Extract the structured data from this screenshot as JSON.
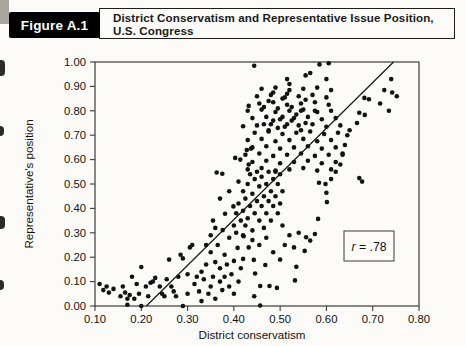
{
  "figure": {
    "label": "Figure A.1",
    "title_line1": "District Conservatism and Representative Issue Position,",
    "title_line2": "U.S. Congress"
  },
  "colors": {
    "page_bg": "#fcfbf8",
    "ink": "#121212",
    "frame": "#3c3c3c",
    "header_bg": "#000000",
    "header_text": "#ffffff"
  },
  "chart_data": {
    "type": "scatter",
    "title": "District Conservatism and Representative Issue Position, U.S. Congress",
    "xlabel": "District conservatism",
    "ylabel": "Representative's position",
    "xlim": [
      0.1,
      0.8
    ],
    "ylim": [
      0.0,
      1.0
    ],
    "x_ticks": [
      "0.10",
      "0.20",
      "0.30",
      "0.40",
      "0.50",
      "0.60",
      "0.70",
      "0.80"
    ],
    "y_ticks": [
      "0.00",
      "0.10",
      "0.20",
      "0.30",
      "0.40",
      "0.50",
      "0.60",
      "0.70",
      "0.80",
      "0.90",
      "1.00"
    ],
    "grid": false,
    "frame": true,
    "annotation": {
      "text": "r = .78"
    },
    "regression_line": {
      "x1": 0.211,
      "y1": 0.0,
      "x2": 0.745,
      "y2": 1.0
    },
    "points": [
      [
        0.11,
        0.09
      ],
      [
        0.118,
        0.065
      ],
      [
        0.125,
        0.08
      ],
      [
        0.13,
        0.055
      ],
      [
        0.14,
        0.07
      ],
      [
        0.155,
        0.04
      ],
      [
        0.16,
        0.08
      ],
      [
        0.165,
        0.055
      ],
      [
        0.17,
        0.03
      ],
      [
        0.17,
        0.005
      ],
      [
        0.175,
        0.045
      ],
      [
        0.18,
        0.12
      ],
      [
        0.185,
        0.03
      ],
      [
        0.19,
        0.09
      ],
      [
        0.195,
        0.05
      ],
      [
        0.2,
        0.16
      ],
      [
        0.2,
        0.0
      ],
      [
        0.21,
        0.08
      ],
      [
        0.215,
        0.04
      ],
      [
        0.22,
        0.095
      ],
      [
        0.225,
        0.1
      ],
      [
        0.23,
        0.115
      ],
      [
        0.24,
        0.08
      ],
      [
        0.245,
        0.05
      ],
      [
        0.25,
        0.04
      ],
      [
        0.255,
        0.11
      ],
      [
        0.26,
        0.19
      ],
      [
        0.265,
        0.08
      ],
      [
        0.27,
        0.06
      ],
      [
        0.275,
        0.04
      ],
      [
        0.28,
        0.12
      ],
      [
        0.285,
        0.21
      ],
      [
        0.29,
        0.195
      ],
      [
        0.29,
        0.0
      ],
      [
        0.3,
        0.05
      ],
      [
        0.3,
        0.13
      ],
      [
        0.305,
        0.24
      ],
      [
        0.31,
        0.25
      ],
      [
        0.315,
        0.09
      ],
      [
        0.32,
        0.12
      ],
      [
        0.325,
        0.06
      ],
      [
        0.33,
        0.02
      ],
      [
        0.33,
        0.14
      ],
      [
        0.335,
        0.11
      ],
      [
        0.34,
        0.17
      ],
      [
        0.345,
        0.05
      ],
      [
        0.35,
        0.08
      ],
      [
        0.35,
        0.22
      ],
      [
        0.355,
        0.12
      ],
      [
        0.36,
        0.03
      ],
      [
        0.36,
        0.18
      ],
      [
        0.365,
        0.25
      ],
      [
        0.37,
        0.1
      ],
      [
        0.37,
        0.155
      ],
      [
        0.375,
        0.065
      ],
      [
        0.38,
        0.12
      ],
      [
        0.38,
        0.21
      ],
      [
        0.385,
        0.17
      ],
      [
        0.39,
        0.08
      ],
      [
        0.39,
        0.28
      ],
      [
        0.395,
        0.13
      ],
      [
        0.4,
        0.05
      ],
      [
        0.4,
        0.185
      ],
      [
        0.405,
        0.3
      ],
      [
        0.408,
        0.238
      ],
      [
        0.41,
        0.1
      ],
      [
        0.415,
        0.155
      ],
      [
        0.42,
        0.193
      ],
      [
        0.42,
        0.29
      ],
      [
        0.421,
        0.286
      ],
      [
        0.381,
        0.378
      ],
      [
        0.376,
        0.311
      ],
      [
        0.399,
        0.408
      ],
      [
        0.36,
        0.32
      ],
      [
        0.35,
        0.29
      ],
      [
        0.34,
        0.25
      ],
      [
        0.355,
        0.35
      ],
      [
        0.37,
        0.44
      ],
      [
        0.39,
        0.47
      ],
      [
        0.41,
        0.51
      ],
      [
        0.4,
        0.33
      ],
      [
        0.405,
        0.38
      ],
      [
        0.41,
        0.42
      ],
      [
        0.415,
        0.35
      ],
      [
        0.42,
        0.47
      ],
      [
        0.42,
        0.39
      ],
      [
        0.425,
        0.33
      ],
      [
        0.425,
        0.44
      ],
      [
        0.43,
        0.5
      ],
      [
        0.43,
        0.36
      ],
      [
        0.435,
        0.41
      ],
      [
        0.435,
        0.54
      ],
      [
        0.44,
        0.31
      ],
      [
        0.44,
        0.46
      ],
      [
        0.445,
        0.52
      ],
      [
        0.445,
        0.38
      ],
      [
        0.45,
        0.43
      ],
      [
        0.45,
        0.55
      ],
      [
        0.455,
        0.35
      ],
      [
        0.455,
        0.49
      ],
      [
        0.46,
        0.41
      ],
      [
        0.46,
        0.53
      ],
      [
        0.465,
        0.45
      ],
      [
        0.465,
        0.32
      ],
      [
        0.47,
        0.5
      ],
      [
        0.47,
        0.38
      ],
      [
        0.475,
        0.55
      ],
      [
        0.475,
        0.43
      ],
      [
        0.48,
        0.47
      ],
      [
        0.48,
        0.35
      ],
      [
        0.485,
        0.52
      ],
      [
        0.485,
        0.41
      ],
      [
        0.49,
        0.55
      ],
      [
        0.49,
        0.45
      ],
      [
        0.495,
        0.38
      ],
      [
        0.495,
        0.5
      ],
      [
        0.5,
        0.42
      ],
      [
        0.5,
        0.54
      ],
      [
        0.505,
        0.47
      ],
      [
        0.505,
        0.33
      ],
      [
        0.43,
        0.56
      ],
      [
        0.46,
        0.565
      ],
      [
        0.49,
        0.555
      ],
      [
        0.52,
        0.56
      ],
      [
        0.55,
        0.565
      ],
      [
        0.58,
        0.555
      ],
      [
        0.61,
        0.56
      ],
      [
        0.44,
        0.59
      ],
      [
        0.47,
        0.595
      ],
      [
        0.5,
        0.585
      ],
      [
        0.53,
        0.59
      ],
      [
        0.56,
        0.595
      ],
      [
        0.59,
        0.585
      ],
      [
        0.62,
        0.59
      ],
      [
        0.425,
        0.62
      ],
      [
        0.455,
        0.625
      ],
      [
        0.485,
        0.615
      ],
      [
        0.515,
        0.62
      ],
      [
        0.545,
        0.625
      ],
      [
        0.575,
        0.615
      ],
      [
        0.605,
        0.62
      ],
      [
        0.635,
        0.625
      ],
      [
        0.44,
        0.65
      ],
      [
        0.47,
        0.655
      ],
      [
        0.5,
        0.645
      ],
      [
        0.53,
        0.65
      ],
      [
        0.56,
        0.655
      ],
      [
        0.59,
        0.645
      ],
      [
        0.62,
        0.65
      ],
      [
        0.43,
        0.68
      ],
      [
        0.46,
        0.685
      ],
      [
        0.49,
        0.675
      ],
      [
        0.52,
        0.68
      ],
      [
        0.55,
        0.685
      ],
      [
        0.58,
        0.675
      ],
      [
        0.61,
        0.68
      ],
      [
        0.445,
        0.71
      ],
      [
        0.475,
        0.715
      ],
      [
        0.505,
        0.705
      ],
      [
        0.535,
        0.71
      ],
      [
        0.565,
        0.715
      ],
      [
        0.595,
        0.705
      ],
      [
        0.625,
        0.71
      ],
      [
        0.42,
        0.737
      ],
      [
        0.45,
        0.74
      ],
      [
        0.48,
        0.745
      ],
      [
        0.51,
        0.735
      ],
      [
        0.54,
        0.74
      ],
      [
        0.57,
        0.745
      ],
      [
        0.6,
        0.735
      ],
      [
        0.63,
        0.74
      ],
      [
        0.44,
        0.77
      ],
      [
        0.47,
        0.775
      ],
      [
        0.5,
        0.765
      ],
      [
        0.53,
        0.77
      ],
      [
        0.56,
        0.775
      ],
      [
        0.59,
        0.765
      ],
      [
        0.62,
        0.77
      ],
      [
        0.43,
        0.8
      ],
      [
        0.46,
        0.805
      ],
      [
        0.49,
        0.795
      ],
      [
        0.52,
        0.8
      ],
      [
        0.55,
        0.805
      ],
      [
        0.58,
        0.795
      ],
      [
        0.61,
        0.8
      ],
      [
        0.432,
        0.82
      ],
      [
        0.455,
        0.83
      ],
      [
        0.485,
        0.835
      ],
      [
        0.515,
        0.825
      ],
      [
        0.545,
        0.83
      ],
      [
        0.575,
        0.835
      ],
      [
        0.605,
        0.825
      ],
      [
        0.45,
        0.86
      ],
      [
        0.48,
        0.865
      ],
      [
        0.51,
        0.855
      ],
      [
        0.54,
        0.86
      ],
      [
        0.57,
        0.865
      ],
      [
        0.6,
        0.855
      ],
      [
        0.46,
        0.89
      ],
      [
        0.49,
        0.895
      ],
      [
        0.52,
        0.885
      ],
      [
        0.55,
        0.89
      ],
      [
        0.58,
        0.895
      ],
      [
        0.61,
        0.885
      ],
      [
        0.475,
        0.72
      ],
      [
        0.495,
        0.73
      ],
      [
        0.515,
        0.745
      ],
      [
        0.525,
        0.76
      ],
      [
        0.545,
        0.72
      ],
      [
        0.485,
        0.76
      ],
      [
        0.505,
        0.775
      ],
      [
        0.465,
        0.745
      ],
      [
        0.535,
        0.785
      ],
      [
        0.555,
        0.75
      ],
      [
        0.495,
        0.81
      ],
      [
        0.525,
        0.815
      ],
      [
        0.475,
        0.84
      ],
      [
        0.555,
        0.845
      ],
      [
        0.505,
        0.85
      ],
      [
        0.465,
        0.815
      ],
      [
        0.545,
        0.8
      ],
      [
        0.515,
        0.87
      ],
      [
        0.485,
        0.875
      ],
      [
        0.575,
        0.8
      ],
      [
        0.363,
        0.547
      ],
      [
        0.375,
        0.542
      ],
      [
        0.403,
        0.607
      ],
      [
        0.414,
        0.6
      ],
      [
        0.428,
        0.639
      ],
      [
        0.437,
        0.645
      ],
      [
        0.432,
        0.58
      ],
      [
        0.444,
        0.985
      ],
      [
        0.585,
        0.99
      ],
      [
        0.605,
        0.995
      ],
      [
        0.515,
        0.93
      ],
      [
        0.52,
        0.91
      ],
      [
        0.555,
        0.945
      ],
      [
        0.6,
        0.93
      ],
      [
        0.565,
        0.955
      ],
      [
        0.74,
        0.93
      ],
      [
        0.742,
        0.875
      ],
      [
        0.725,
        0.885
      ],
      [
        0.735,
        0.8
      ],
      [
        0.716,
        0.83
      ],
      [
        0.682,
        0.853
      ],
      [
        0.692,
        0.847
      ],
      [
        0.671,
        0.792
      ],
      [
        0.683,
        0.783
      ],
      [
        0.666,
        0.75
      ],
      [
        0.671,
        0.524
      ],
      [
        0.677,
        0.51
      ],
      [
        0.752,
        0.86
      ],
      [
        0.556,
        0.282
      ],
      [
        0.565,
        0.268
      ],
      [
        0.553,
        0.226
      ],
      [
        0.575,
        0.295
      ],
      [
        0.582,
        0.357
      ],
      [
        0.601,
        0.426
      ],
      [
        0.6,
        0.464
      ],
      [
        0.598,
        0.5
      ],
      [
        0.584,
        0.505
      ],
      [
        0.61,
        0.52
      ],
      [
        0.62,
        0.55
      ],
      [
        0.63,
        0.58
      ],
      [
        0.635,
        0.62
      ],
      [
        0.64,
        0.66
      ],
      [
        0.645,
        0.7
      ],
      [
        0.65,
        0.72
      ],
      [
        0.444,
        0.04
      ],
      [
        0.457,
        0.002
      ],
      [
        0.457,
        0.082
      ],
      [
        0.477,
        0.082
      ],
      [
        0.493,
        0.074
      ],
      [
        0.532,
        0.105
      ],
      [
        0.535,
        0.161
      ],
      [
        0.468,
        0.168
      ],
      [
        0.446,
        0.133
      ],
      [
        0.443,
        0.189
      ],
      [
        0.432,
        0.24
      ],
      [
        0.455,
        0.25
      ],
      [
        0.47,
        0.28
      ],
      [
        0.485,
        0.22
      ],
      [
        0.5,
        0.19
      ],
      [
        0.51,
        0.25
      ],
      [
        0.52,
        0.29
      ],
      [
        0.53,
        0.24
      ],
      [
        0.54,
        0.3
      ],
      [
        0.44,
        0.27
      ]
    ]
  }
}
